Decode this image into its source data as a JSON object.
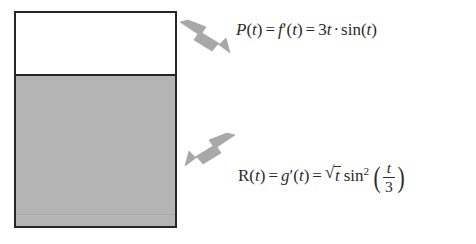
{
  "diagram": {
    "type": "tank-rate-diagram",
    "tank": {
      "name": "container",
      "empty_region_label": "",
      "filled_region_label": "",
      "fill_color": "#b4b4b4",
      "empty_color": "#ffffff",
      "border_color": "#262626"
    },
    "arrows": [
      {
        "name": "inflow-arrow",
        "direction": "down-left",
        "color": "#a8a8a8",
        "points_to": "tank-empty-region"
      },
      {
        "name": "outflow-arrow",
        "direction": "down-right",
        "color": "#a8a8a8",
        "points_to": "outflow-equation"
      }
    ],
    "equations": {
      "inflow": {
        "name": "P(t)",
        "lhs": "P",
        "var": "t",
        "equals": "=",
        "middle_fn": "f",
        "prime": "′",
        "coefficient": "3",
        "coefficient_var": "t",
        "dot": "·",
        "trig": "sin",
        "trig_arg": "t",
        "plain": "P(t) = f′(t) = 3t · sin(t)"
      },
      "outflow": {
        "name": "R(t)",
        "lhs": "R",
        "var": "t",
        "equals": "=",
        "middle_fn": "g",
        "prime": "′",
        "radical": "√",
        "radicand": "t",
        "trig": "sin",
        "trig_exponent": "2",
        "frac_numerator": "t",
        "frac_denominator": "3",
        "paren_open": "(",
        "paren_close": ")",
        "plain": "R(t) = g′(t) = √t sin²(t/3)"
      }
    }
  }
}
